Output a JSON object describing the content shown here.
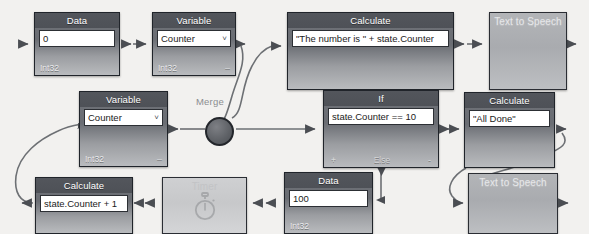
{
  "diagram": {
    "title_fragment": "",
    "merge": {
      "label": "Merge",
      "name": "merge-junction"
    },
    "nodes": [
      {
        "id": "data-0",
        "kind": "data",
        "header": "Data",
        "value": "0",
        "footer_left": "Int32",
        "footer_right": "",
        "x": 34,
        "y": 12,
        "w": 86,
        "h": 64
      },
      {
        "id": "variable-counter-top",
        "kind": "variable",
        "header": "Variable",
        "value": "Counter",
        "chevron": "˅",
        "footer_left": "Int32",
        "footer_right": "–",
        "x": 152,
        "y": 12,
        "w": 84,
        "h": 64
      },
      {
        "id": "calculate-number-is",
        "kind": "calculate",
        "header": "Calculate",
        "value": "\"The number is \" + state.Counter",
        "footer_left": "",
        "footer_right": "",
        "x": 287,
        "y": 12,
        "w": 167,
        "h": 78
      },
      {
        "id": "text-to-speech-top",
        "kind": "text-to-speech",
        "header": "Text to Speech",
        "x": 489,
        "y": 12,
        "w": 78,
        "h": 78
      },
      {
        "id": "variable-counter-mid",
        "kind": "variable",
        "header": "Variable",
        "value": "Counter",
        "chevron": "˅",
        "footer_left": "Int32",
        "footer_right": "–",
        "x": 79,
        "y": 91,
        "w": 89,
        "h": 76
      },
      {
        "id": "if-node",
        "kind": "if",
        "header": "If",
        "value": "state.Counter == 10",
        "footer_left": "+",
        "footer_mid": "Else",
        "footer_right": "-",
        "x": 323,
        "y": 90,
        "w": 116,
        "h": 78
      },
      {
        "id": "calculate-all-done",
        "kind": "calculate",
        "header": "Calculate",
        "value": "\"All Done\"",
        "footer_left": "",
        "footer_right": "",
        "x": 464,
        "y": 92,
        "w": 91,
        "h": 76
      },
      {
        "id": "calculate-counter-plus-1",
        "kind": "calculate",
        "header": "Calculate",
        "value": "state.Counter + 1",
        "footer_left": "",
        "footer_right": "",
        "x": 35,
        "y": 177,
        "w": 98,
        "h": 57
      },
      {
        "id": "timer-node",
        "kind": "timer",
        "header": "Timer",
        "icon": "stopwatch-icon",
        "x": 162,
        "y": 177,
        "w": 85,
        "h": 57
      },
      {
        "id": "data-100",
        "kind": "data",
        "header": "Data",
        "value": "100",
        "footer_left": "Int32",
        "footer_right": "",
        "x": 284,
        "y": 172,
        "w": 89,
        "h": 62
      },
      {
        "id": "text-to-speech-bottom",
        "kind": "text-to-speech",
        "header": "Text to Speech",
        "x": 468,
        "y": 173,
        "w": 90,
        "h": 61
      }
    ],
    "colors": {
      "canvas_bg": "#f2f1ef",
      "node_header": "#53565c",
      "node_body_top": "#6f7278",
      "node_body_bottom": "#b9bbbe",
      "node_border": "#20242a",
      "field_bg": "#ffffff",
      "field_text": "#1b1b1b",
      "flat_node": "#b3b5b8",
      "wire": "#6d7074",
      "merge_fill": "#5d6065",
      "merge_label": "#8b8d90"
    }
  }
}
